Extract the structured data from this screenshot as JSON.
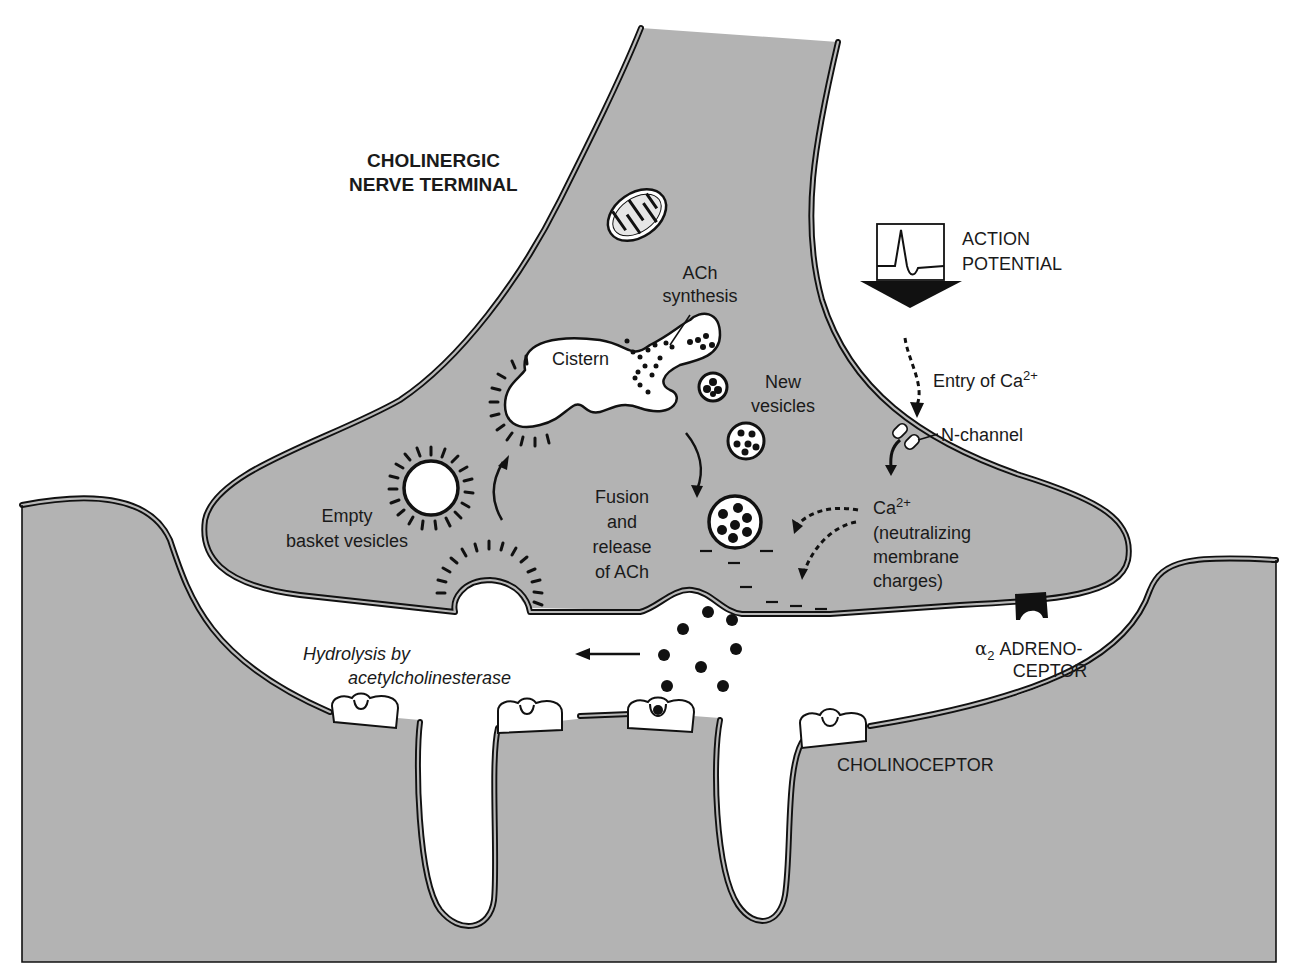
{
  "diagram": {
    "title_label": {
      "line1": "CHOLINERGIC",
      "line2": "NERVE TERMINAL"
    },
    "labels": {
      "action_potential": {
        "line1": "ACTION",
        "line2": "POTENTIAL"
      },
      "ach_synthesis": {
        "line1": "ACh",
        "line2": "synthesis"
      },
      "cistern": "Cistern",
      "new_vesicles": {
        "line1": "New",
        "line2": "vesicles"
      },
      "entry_of_ca": {
        "text": "Entry of Ca",
        "sup": "2+"
      },
      "n_channel": "N-channel",
      "empty_basket": {
        "line1": "Empty",
        "line2": "basket vesicles"
      },
      "fusion_release": {
        "line1": "Fusion",
        "line2": "and",
        "line3": "release",
        "line4": "of ACh"
      },
      "ca_neutralizing": {
        "line1": "Ca",
        "line1_sup": "2+",
        "line2": "(neutralizing",
        "line3": "membrane",
        "line4": "charges)"
      },
      "hydrolysis": {
        "line1": "Hydrolysis by",
        "line2": "acetylcholinesterase"
      },
      "alpha2_adrenoceptor": {
        "greek": "α",
        "sub": "2",
        "line1": " ADRENO-",
        "line2": "CEPTOR"
      },
      "cholinoceptor": "CHOLINOCEPTOR"
    },
    "colors": {
      "cell_fill": "#b3b3b3",
      "ink": "#111111",
      "background": "#ffffff"
    },
    "icons": [
      "mitochondrion-icon",
      "action-potential-waveform-icon",
      "down-arrow-icon",
      "n-channel-icon",
      "vesicle-icon",
      "coated-vesicle-icon",
      "ach-molecule-icon",
      "cholinoceptor-icon",
      "alpha2-adrenoceptor-icon"
    ]
  }
}
